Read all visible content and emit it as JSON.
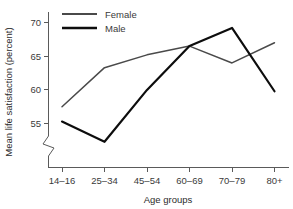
{
  "chart_data": {
    "type": "line",
    "title": "",
    "xlabel": "Age groups",
    "ylabel": "Mean life satisfaction (percent)",
    "categories": [
      "14–16",
      "25–34",
      "45–54",
      "60–69",
      "70–79",
      "80+"
    ],
    "series": [
      {
        "name": "Female",
        "color": "#4a4a4a",
        "values": [
          57.5,
          63.3,
          65.2,
          66.5,
          64.0,
          67.0
        ]
      },
      {
        "name": "Male",
        "color": "#0d0d0d",
        "values": [
          55.3,
          52.3,
          60.0,
          66.5,
          69.2,
          59.8
        ]
      }
    ],
    "yticks": [
      55,
      60,
      65,
      70
    ],
    "ytick_labels": [
      "55",
      "60",
      "65",
      "70"
    ],
    "ylim": [
      52.0,
      71.0
    ],
    "axis_break": true,
    "grid": false,
    "legend_position": "top-left-inside"
  },
  "axes": {
    "y_title": "Mean life satisfaction (percent)",
    "x_title": "Age groups"
  },
  "legend": {
    "entries": [
      {
        "label": "Female"
      },
      {
        "label": "Male"
      }
    ]
  },
  "ticks": {
    "y": [
      "70",
      "65",
      "60",
      "55"
    ],
    "x": [
      "14–16",
      "25–34",
      "45–54",
      "60–69",
      "70–79",
      "80+"
    ]
  }
}
